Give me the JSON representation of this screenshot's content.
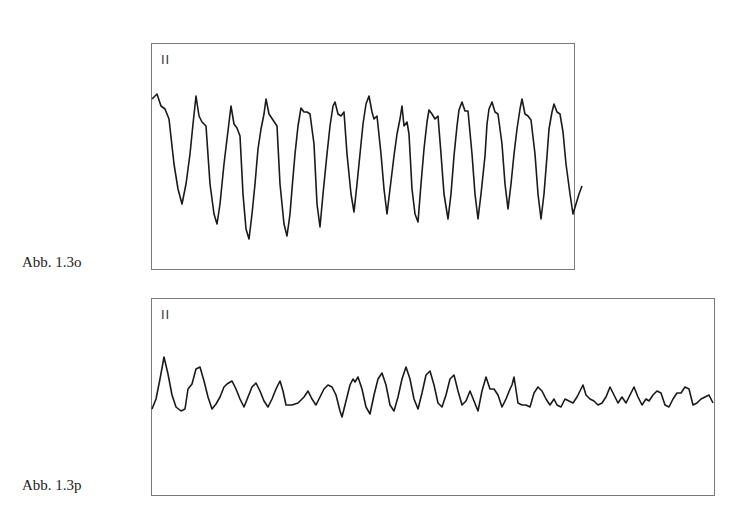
{
  "figures": [
    {
      "id": "o",
      "caption": "Abb. 1.3o",
      "lead": "II",
      "points": "0,55 5,50 9,62 13,65 17,75 22,120 26,145 30,160 34,140 38,110 41,80 44,52 47,72 50,78 54,82 58,140 62,170 65,180 68,160 72,120 75,95 79,62 82,80 85,84 88,92 91,150 94,185 97,195 100,170 103,140 106,105 109,85 112,70 114,55 117,70 121,76 125,82 128,140 132,180 135,192 138,170 140,145 143,110 146,82 149,64 152,68 155,68 158,70 162,100 165,160 168,183 171,150 175,110 178,82 181,62 183,58 186,70 189,72 192,68 195,110 199,150 202,168 205,140 208,110 211,80 214,60 217,52 220,68 222,75 225,72 229,110 232,145 235,170 238,145 242,112 245,90 248,75 250,62 252,82 255,78 257,90 260,145 263,170 266,178 269,140 272,105 275,78 277,66 280,70 283,75 286,72 289,110 292,150 296,175 299,150 302,112 305,82 307,66 310,58 313,67 316,67 320,110 323,150 326,175 329,150 333,112 335,80 337,65 340,58 343,68 346,70 350,100 353,140 356,165 359,140 362,110 365,85 368,65 370,55 373,70 376,72 379,76 383,110 386,150 389,175 392,150 395,112 397,85 400,68 402,60 405,68 408,70 411,88 414,120 418,150 421,170 424,160 427,150 430,142"
    },
    {
      "id": "p",
      "caption": "Abb. 1.3p",
      "lead": "II",
      "points": "0,110 4,100 8,80 12,58 16,75 20,96 24,108 29,112 33,110 36,90 40,85 44,70 48,68 52,82 56,98 60,110 64,105 68,98 72,88 75,85 80,82 84,90 88,100 92,108 96,98 100,88 104,84 108,92 112,102 116,108 120,100 124,90 128,82 131,92 134,106 140,106 146,104 152,98 156,92 160,100 164,106 168,98 172,90 176,86 180,88 184,96 188,112 190,118 194,102 198,86 201,80 203,83 206,78 210,90 214,108 218,115 222,96 226,80 230,74 234,86 238,106 242,112 246,98 250,80 254,68 258,80 262,100 266,110 270,94 274,76 278,72 282,86 286,104 290,108 294,96 298,80 302,76 306,92 310,106 314,102 318,92 322,102 326,112 330,92 334,78 338,90 342,90 346,96 350,108 354,100 358,90 360,86 362,78 366,104 370,106 374,106 378,108 382,94 386,88 390,92 394,100 398,106 402,100 405,106 409,108 413,100 417,102 421,104 425,98 428,92 431,86 434,96 438,100 442,102 446,106 450,104 454,98 458,88 462,96 466,104 470,98 474,104 478,96 482,88 486,98 490,106 494,100 497,102 501,96 505,92 509,94 513,106 517,108 521,100 525,94 529,94 533,88 537,90 541,106 545,104 549,100 553,98 557,96 561,104"
    }
  ],
  "chart_data": [
    {
      "type": "line",
      "title": "Abb. 1.3o",
      "lead_label": "II",
      "description": "ECG lead II strip, regular high-amplitude sinusoidal undulations (approx. 15 cycles across the strip)",
      "xlabel": "",
      "ylabel": "",
      "grid": false,
      "approx_cycles": 15,
      "relative_amplitude": "large"
    },
    {
      "type": "line",
      "title": "Abb. 1.3p",
      "lead_label": "II",
      "description": "ECG lead II strip, irregular low-amplitude fibrillatory waves with variable morphology",
      "xlabel": "",
      "ylabel": "",
      "grid": false,
      "relative_amplitude": "small"
    }
  ]
}
